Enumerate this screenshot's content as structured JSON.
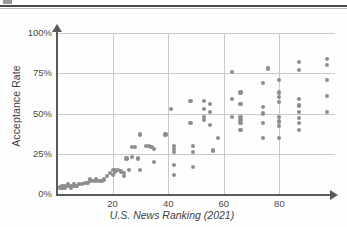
{
  "page": {
    "top_fragment": "",
    "background": "#fefefe"
  },
  "axes": {
    "y_title": "Acceptance Rate",
    "x_title": "U.S. News Ranking (2021)",
    "y_ticks": [
      "100%",
      "75%",
      "50%",
      "25%",
      "0%"
    ],
    "x_ticks": [
      "20",
      "40",
      "60",
      "80"
    ]
  },
  "colors": {
    "point": "#8d8d8d",
    "grid": "#c9c9c9",
    "axis": "#5a5a5a",
    "text": "#3f3f3f"
  },
  "chart_data": {
    "type": "scatter",
    "title": "",
    "xlabel": "U.S. News Ranking (2021)",
    "ylabel": "Acceptance Rate",
    "xlim": [
      0,
      100
    ],
    "ylim": [
      0,
      100
    ],
    "xticks": [
      20,
      40,
      60,
      80
    ],
    "yticks": [
      0,
      25,
      50,
      75,
      100
    ],
    "ytick_labels": [
      "0%",
      "25%",
      "50%",
      "75%",
      "100%"
    ],
    "grid": true,
    "legend": null,
    "y_unit": "percent",
    "series": [
      {
        "name": "Universities",
        "points": [
          [
            1,
            4
          ],
          [
            2,
            5
          ],
          [
            2,
            4
          ],
          [
            3,
            5
          ],
          [
            3,
            4
          ],
          [
            4,
            5
          ],
          [
            4,
            6
          ],
          [
            5,
            5
          ],
          [
            5,
            4
          ],
          [
            6,
            6
          ],
          [
            6,
            5
          ],
          [
            7,
            5
          ],
          [
            8,
            6
          ],
          [
            9,
            6
          ],
          [
            10,
            7
          ],
          [
            11,
            7
          ],
          [
            12,
            9
          ],
          [
            12,
            8
          ],
          [
            13,
            8
          ],
          [
            14,
            8
          ],
          [
            14,
            9
          ],
          [
            15,
            8
          ],
          [
            16,
            8
          ],
          [
            17,
            9
          ],
          [
            18,
            11
          ],
          [
            19,
            13
          ],
          [
            20,
            15
          ],
          [
            20,
            12
          ],
          [
            21,
            15
          ],
          [
            21,
            14
          ],
          [
            22,
            15
          ],
          [
            23,
            14
          ],
          [
            24,
            13
          ],
          [
            24,
            11
          ],
          [
            25,
            22
          ],
          [
            26,
            15
          ],
          [
            27,
            29
          ],
          [
            27,
            23
          ],
          [
            28,
            29
          ],
          [
            29,
            22
          ],
          [
            30,
            37
          ],
          [
            30,
            15
          ],
          [
            32,
            30
          ],
          [
            33,
            30
          ],
          [
            34,
            29
          ],
          [
            35,
            28
          ],
          [
            35,
            20
          ],
          [
            39,
            37
          ],
          [
            41,
            53
          ],
          [
            42,
            30
          ],
          [
            42,
            28
          ],
          [
            42,
            26
          ],
          [
            42,
            18
          ],
          [
            42,
            12
          ],
          [
            48,
            58
          ],
          [
            48,
            44
          ],
          [
            49,
            30
          ],
          [
            49,
            26
          ],
          [
            49,
            17
          ],
          [
            53,
            58
          ],
          [
            53,
            53
          ],
          [
            53,
            48
          ],
          [
            53,
            46
          ],
          [
            55,
            56
          ],
          [
            55,
            51
          ],
          [
            55,
            43
          ],
          [
            56,
            27
          ],
          [
            58,
            35
          ],
          [
            63,
            76
          ],
          [
            63,
            59
          ],
          [
            63,
            48
          ],
          [
            66,
            63
          ],
          [
            66,
            56
          ],
          [
            66,
            48
          ],
          [
            66,
            46
          ],
          [
            66,
            44
          ],
          [
            66,
            40
          ],
          [
            74,
            69
          ],
          [
            74,
            54
          ],
          [
            74,
            50
          ],
          [
            74,
            44
          ],
          [
            74,
            35
          ],
          [
            76,
            78
          ],
          [
            80,
            71
          ],
          [
            80,
            63
          ],
          [
            80,
            60
          ],
          [
            80,
            57
          ],
          [
            80,
            48
          ],
          [
            80,
            45
          ],
          [
            80,
            42
          ],
          [
            80,
            35
          ],
          [
            87,
            82
          ],
          [
            87,
            77
          ],
          [
            87,
            59
          ],
          [
            87,
            55
          ],
          [
            87,
            51
          ],
          [
            87,
            47
          ],
          [
            87,
            44
          ],
          [
            87,
            40
          ],
          [
            97,
            84
          ],
          [
            97,
            80
          ],
          [
            97,
            71
          ],
          [
            97,
            61
          ],
          [
            97,
            51
          ]
        ]
      }
    ]
  }
}
